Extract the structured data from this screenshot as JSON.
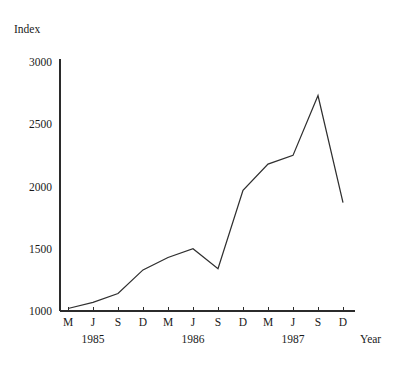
{
  "chart_data": {
    "type": "line",
    "title": "",
    "subtitle": "",
    "ylabel": "Index",
    "xlabel": "Year",
    "ylim": [
      1000,
      3000
    ],
    "yticks": [
      1000,
      1500,
      2000,
      2500,
      3000
    ],
    "ytick_labels": [
      "1000",
      "1500",
      "2000",
      "2500",
      "3000"
    ],
    "grid": false,
    "legend": null,
    "categories": [
      "M",
      "J",
      "S",
      "D",
      "M",
      "J",
      "S",
      "D",
      "M",
      "J",
      "S",
      "D"
    ],
    "values": [
      1020,
      1070,
      1140,
      1330,
      1430,
      1500,
      1340,
      1970,
      2180,
      2250,
      2730,
      1870
    ],
    "x_group_labels": [
      "1985",
      "1986",
      "1987"
    ],
    "x_groups": [
      {
        "label": "1985",
        "months": [
          "M",
          "J",
          "S",
          "D"
        ]
      },
      {
        "label": "1986",
        "months": [
          "M",
          "J",
          "S",
          "D"
        ]
      },
      {
        "label": "1987",
        "months": [
          "M",
          "J",
          "S",
          "D"
        ]
      }
    ],
    "series": [
      {
        "name": "Index",
        "values": [
          1020,
          1070,
          1140,
          1330,
          1430,
          1500,
          1340,
          1970,
          2180,
          2250,
          2730,
          1870
        ]
      }
    ],
    "line_color": "#2f2f2f",
    "background_color": "#ffffff"
  }
}
